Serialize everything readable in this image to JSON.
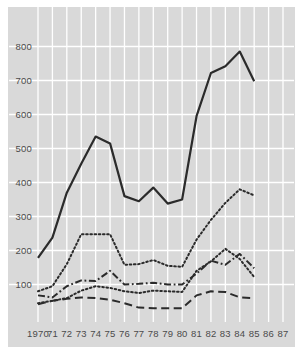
{
  "chart_data": {
    "type": "line",
    "title": "",
    "subtitle": "",
    "xlabel": "",
    "ylabel": "",
    "x": [
      1970,
      1971,
      1972,
      1973,
      1974,
      1975,
      1976,
      1977,
      1978,
      1979,
      1980,
      1981,
      1982,
      1983,
      1984,
      1985,
      1986,
      1987
    ],
    "xtick_labels": [
      "1970",
      "71",
      "72",
      "73",
      "74",
      "75",
      "76",
      "77",
      "78",
      "79",
      "80",
      "81",
      "82",
      "83",
      "84",
      "85",
      "86",
      "87"
    ],
    "ytick_labels": [
      "100",
      "200",
      "300",
      "400",
      "500",
      "600",
      "700",
      "800"
    ],
    "ytick_values": [
      100,
      200,
      300,
      400,
      500,
      600,
      700,
      800
    ],
    "xlim": [
      1970,
      1987
    ],
    "ylim": [
      0,
      860
    ],
    "grid": true,
    "legend": "none",
    "background_color": "#d9d9d9",
    "gridline_color": "#ffffff",
    "line_color": "#2b2b2b",
    "series": [
      {
        "name": "solid-series",
        "style": "solid",
        "x": [
          1970,
          1971,
          1972,
          1973,
          1974,
          1975,
          1976,
          1977,
          1978,
          1979,
          1980,
          1981,
          1982,
          1983,
          1984,
          1985
        ],
        "values": [
          178,
          238,
          370,
          455,
          535,
          515,
          360,
          345,
          385,
          338,
          350,
          595,
          722,
          742,
          785,
          698
        ]
      },
      {
        "name": "dotted-series-upper",
        "style": "dotted",
        "x": [
          1970,
          1971,
          1972,
          1973,
          1974,
          1975,
          1976,
          1977,
          1978,
          1979,
          1980,
          1981,
          1982,
          1983,
          1984,
          1985
        ],
        "values": [
          80,
          95,
          160,
          248,
          248,
          248,
          158,
          160,
          172,
          155,
          152,
          232,
          290,
          340,
          380,
          362
        ]
      },
      {
        "name": "dash-dot-series",
        "style": "dash-dot",
        "x": [
          1970,
          1971,
          1972,
          1973,
          1974,
          1975,
          1976,
          1977,
          1978,
          1979,
          1980,
          1981,
          1982,
          1983,
          1984,
          1985
        ],
        "values": [
          68,
          62,
          95,
          112,
          110,
          140,
          100,
          102,
          105,
          100,
          100,
          132,
          170,
          158,
          190,
          148
        ]
      },
      {
        "name": "dotted-series-lower",
        "style": "dotted",
        "x": [
          1970,
          1971,
          1972,
          1973,
          1974,
          1975,
          1976,
          1977,
          1978,
          1979,
          1980,
          1981,
          1982,
          1983,
          1984,
          1985
        ],
        "values": [
          45,
          52,
          60,
          82,
          95,
          90,
          80,
          75,
          82,
          80,
          78,
          140,
          168,
          205,
          175,
          122
        ]
      },
      {
        "name": "long-dash-series",
        "style": "long-dash",
        "x": [
          1970,
          1971,
          1972,
          1973,
          1974,
          1975,
          1976,
          1977,
          1978,
          1979,
          1980,
          1981,
          1982,
          1983,
          1984,
          1985
        ],
        "values": [
          42,
          52,
          58,
          62,
          60,
          55,
          45,
          32,
          30,
          30,
          30,
          68,
          80,
          78,
          62,
          60
        ]
      }
    ]
  }
}
